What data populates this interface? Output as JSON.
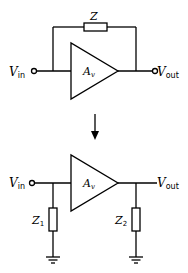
{
  "top_circuit": {
    "feedback_impedance": "Z",
    "amplifier": {
      "symbol": "A",
      "sub": "v"
    },
    "input": {
      "symbol": "V",
      "sub": "in"
    },
    "output": {
      "symbol": "V",
      "sub": "out"
    }
  },
  "arrow": "down",
  "bottom_circuit": {
    "amplifier": {
      "symbol": "A",
      "sub": "v"
    },
    "input": {
      "symbol": "V",
      "sub": "in"
    },
    "output": {
      "symbol": "V",
      "sub": "out"
    },
    "z1": {
      "symbol": "Z",
      "sub": "1"
    },
    "z2": {
      "symbol": "Z",
      "sub": "2"
    }
  }
}
